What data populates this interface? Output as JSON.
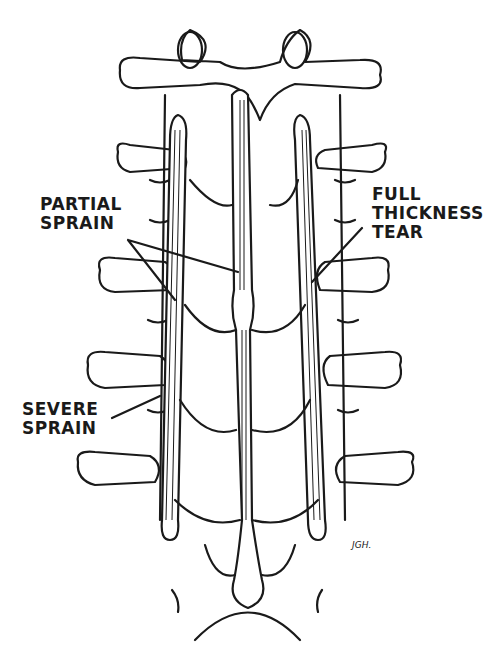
{
  "figure": {
    "labels": {
      "partial_sprain": [
        "PARTIAL",
        "SPRAIN"
      ],
      "full_thickness_tear": [
        "FULL",
        "THICKNESS",
        "TEAR"
      ],
      "severe_sprain": [
        "SEVERE",
        "SPRAIN"
      ]
    },
    "signature": "JGH."
  },
  "colors": {
    "ink": "#1a1a1a",
    "background": "#ffffff"
  }
}
